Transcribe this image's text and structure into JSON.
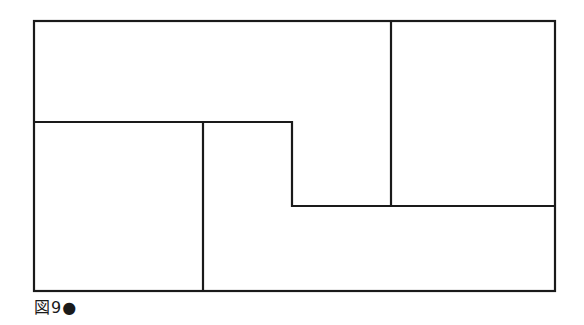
{
  "figure": {
    "caption": "図9●",
    "stroke_color": "#1a1a1a",
    "outer_box": {
      "x1": 34,
      "y1": 21,
      "x2": 555,
      "y2": 291
    },
    "lines": [
      {
        "name": "top-mid-horizontal",
        "points": "34,122 292,122"
      },
      {
        "name": "step-vertical",
        "points": "292,122 292,206"
      },
      {
        "name": "lower-horizontal",
        "points": "292,206 555,206"
      },
      {
        "name": "upper-right-vertical",
        "points": "391,21 391,206"
      },
      {
        "name": "lower-left-vertical",
        "points": "203,122 203,291"
      }
    ],
    "regions": [
      {
        "label": "top-left-region"
      },
      {
        "label": "top-right-region"
      },
      {
        "label": "bottom-left-square"
      },
      {
        "label": "bottom-right-l-region"
      }
    ]
  }
}
